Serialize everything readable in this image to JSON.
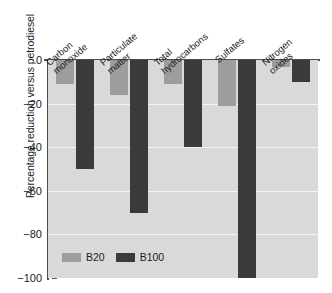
{
  "chart_data": {
    "type": "bar",
    "title": "",
    "xlabel": "",
    "ylabel": "Percentage reduction versus petrodiesel",
    "ylim": [
      -100,
      0
    ],
    "yticks": [
      0,
      -20,
      -40,
      -60,
      -80,
      -100
    ],
    "ytick_labels": [
      "0",
      "−20",
      "−40",
      "−60",
      "−80",
      "−100"
    ],
    "grid": true,
    "legend_position": "bottom-left",
    "categories": [
      "Carbon\nmonoxide",
      "Particulate\nmatter",
      "Total\nhydrocarbons",
      "Sulfates",
      "Nitrogen\noxides"
    ],
    "series": [
      {
        "name": "B20",
        "color": "#9d9d9d",
        "values": [
          -11,
          -16,
          -11,
          -21,
          -3
        ]
      },
      {
        "name": "B100",
        "color": "#3a3a3a",
        "values": [
          -50,
          -70,
          -40,
          -100,
          -10
        ]
      }
    ]
  },
  "legend": {
    "items": [
      {
        "label": "B20",
        "color": "#9d9d9d"
      },
      {
        "label": "B100",
        "color": "#3a3a3a"
      }
    ]
  },
  "colors": {
    "plot_background": "#d9d9d9",
    "gridline": "#f4f4f4",
    "axis": "#4d4d4d",
    "text": "#1b1b1b",
    "page_background": "#ffffff"
  }
}
